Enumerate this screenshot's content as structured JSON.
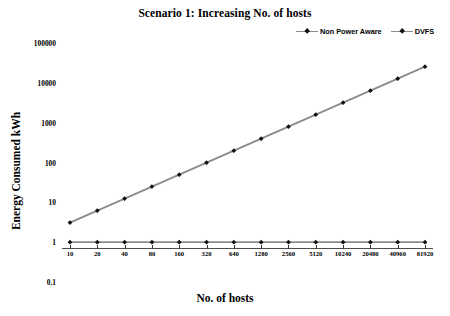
{
  "chart_data": {
    "type": "line",
    "title": "Scenario 1: Increasing No. of hosts",
    "xlabel": "No. of hosts",
    "ylabel": "Energy Consumed kWh",
    "x_scale": "category",
    "y_scale": "log",
    "ylim": [
      0.1,
      100000
    ],
    "grid": false,
    "legend_position": "top-right",
    "categories": [
      "10",
      "20",
      "40",
      "80",
      "160",
      "320",
      "640",
      "1280",
      "2560",
      "5120",
      "10240",
      "20480",
      "40960",
      "81920"
    ],
    "y_ticks": [
      "0.1",
      "1",
      "10",
      "100",
      "1000",
      "10000",
      "100000"
    ],
    "series": [
      {
        "name": "Non Power Aware",
        "color": "#8c8c8c",
        "marker": "diamond",
        "marker_color": "#111111",
        "values": [
          3.1,
          6.2,
          12.4,
          24.8,
          49.6,
          99,
          198,
          397,
          794,
          1587,
          3175,
          6350,
          12700,
          25400
        ]
      },
      {
        "name": "DVFS",
        "color": "#8c8c8c",
        "marker": "diamond",
        "marker_color": "#111111",
        "values": [
          1,
          1,
          1,
          1,
          1,
          1,
          1,
          1,
          1,
          1,
          1,
          1,
          1,
          1
        ]
      }
    ]
  },
  "legend": {
    "entries": [
      {
        "label": "Non Power Aware"
      },
      {
        "label": "DVFS"
      }
    ]
  }
}
